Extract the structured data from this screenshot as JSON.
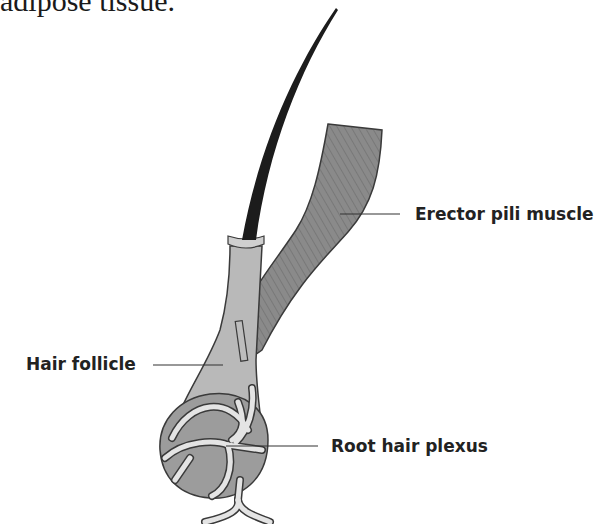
{
  "caption_fragment": "adipose tissue.",
  "labels": {
    "erector": "Erector pili muscle",
    "follicle": "Hair follicle",
    "plexus": "Root hair plexus"
  },
  "colors": {
    "hair_shaft": "#1c1c1c",
    "follicle_fill": "#b9b9b9",
    "bulb_fill": "#9c9c9c",
    "muscle_fill": "#8a8a8a",
    "nerve_fill": "#e4e4e4",
    "outline": "#3a3a3a"
  }
}
